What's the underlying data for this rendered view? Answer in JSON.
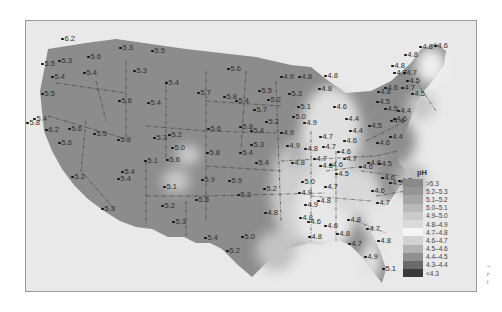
{
  "map": {
    "title": "pH of precipitation, contiguous United States",
    "legend": {
      "title": "pH",
      "items": [
        {
          "label": ">5.3",
          "color": "#8a8a8a"
        },
        {
          "label": "5.2–5.3",
          "color": "#959595"
        },
        {
          "label": "5.1–5.2",
          "color": "#a6a6a6"
        },
        {
          "label": "5.0–5.1",
          "color": "#b9b9b9"
        },
        {
          "label": "4.9–5.0",
          "color": "#cbcbcb"
        },
        {
          "label": "4.8–4.9",
          "color": "#dadada"
        },
        {
          "label": "4.7–4.8",
          "color": "#f4f4f4"
        },
        {
          "label": "4.6–4.7",
          "color": "#d2d2d2"
        },
        {
          "label": "4.5–4.6",
          "color": "#b2b2b2"
        },
        {
          "label": "4.4–4.5",
          "color": "#909090"
        },
        {
          "label": "4.3–4.4",
          "color": "#6a6a6a"
        },
        {
          "label": "<4.3",
          "color": "#3a3a3a"
        }
      ]
    },
    "stations": [
      {
        "v": "6.2",
        "x": 60,
        "y": 38
      },
      {
        "v": "5.3",
        "x": 118,
        "y": 47
      },
      {
        "v": "5.5",
        "x": 150,
        "y": 50
      },
      {
        "v": "5.5",
        "x": 40,
        "y": 63
      },
      {
        "v": "5.3",
        "x": 57,
        "y": 60
      },
      {
        "v": "5.6",
        "x": 86,
        "y": 56
      },
      {
        "v": "5.4",
        "x": 50,
        "y": 76
      },
      {
        "v": "5.4",
        "x": 82,
        "y": 72
      },
      {
        "v": "5.3",
        "x": 132,
        "y": 70
      },
      {
        "v": "5.4",
        "x": 164,
        "y": 82
      },
      {
        "v": "5.5",
        "x": 40,
        "y": 93
      },
      {
        "v": "5.6",
        "x": 117,
        "y": 100
      },
      {
        "v": "5.4",
        "x": 146,
        "y": 102
      },
      {
        "v": "5.4",
        "x": 32,
        "y": 118
      },
      {
        "v": "6.2",
        "x": 44,
        "y": 129
      },
      {
        "v": "5.6",
        "x": 67,
        "y": 128
      },
      {
        "v": "5.6",
        "x": 57,
        "y": 142
      },
      {
        "v": "5.5",
        "x": 92,
        "y": 133
      },
      {
        "v": "5.8",
        "x": 116,
        "y": 139
      },
      {
        "v": "5.8",
        "x": 25,
        "y": 122
      },
      {
        "v": "5.3",
        "x": 152,
        "y": 137
      },
      {
        "v": "5.2",
        "x": 167,
        "y": 134
      },
      {
        "v": "5.0",
        "x": 170,
        "y": 147
      },
      {
        "v": "5.1",
        "x": 143,
        "y": 160
      },
      {
        "v": "5.6",
        "x": 165,
        "y": 159
      },
      {
        "v": "5.4",
        "x": 120,
        "y": 171
      },
      {
        "v": "5.2",
        "x": 70,
        "y": 176
      },
      {
        "v": "5.4",
        "x": 116,
        "y": 178
      },
      {
        "v": "5.3",
        "x": 100,
        "y": 208
      },
      {
        "v": "5.1",
        "x": 162,
        "y": 186
      },
      {
        "v": "5.6",
        "x": 206,
        "y": 128
      },
      {
        "v": "5.8",
        "x": 205,
        "y": 152
      },
      {
        "v": "5.4",
        "x": 238,
        "y": 152
      },
      {
        "v": "5.8",
        "x": 238,
        "y": 126
      },
      {
        "v": "5.4",
        "x": 234,
        "y": 100
      },
      {
        "v": "5.7",
        "x": 196,
        "y": 92
      },
      {
        "v": "5.8",
        "x": 222,
        "y": 96
      },
      {
        "v": "5.6",
        "x": 226,
        "y": 68
      },
      {
        "v": "5.2",
        "x": 266,
        "y": 99
      },
      {
        "v": "5.5",
        "x": 257,
        "y": 90
      },
      {
        "v": "5.7",
        "x": 252,
        "y": 109
      },
      {
        "v": "5.2",
        "x": 264,
        "y": 121
      },
      {
        "v": "5.4",
        "x": 249,
        "y": 130
      },
      {
        "v": "5.3",
        "x": 249,
        "y": 144
      },
      {
        "v": "4.9",
        "x": 285,
        "y": 145
      },
      {
        "v": "5.4",
        "x": 254,
        "y": 162
      },
      {
        "v": "5.9",
        "x": 200,
        "y": 179
      },
      {
        "v": "5.9",
        "x": 227,
        "y": 180
      },
      {
        "v": "5.3",
        "x": 236,
        "y": 194
      },
      {
        "v": "5.2",
        "x": 262,
        "y": 188
      },
      {
        "v": "4.8",
        "x": 263,
        "y": 212
      },
      {
        "v": "5.5",
        "x": 194,
        "y": 199
      },
      {
        "v": "5.2",
        "x": 160,
        "y": 205
      },
      {
        "v": "5.3",
        "x": 171,
        "y": 221
      },
      {
        "v": "5.4",
        "x": 203,
        "y": 237
      },
      {
        "v": "5.0",
        "x": 240,
        "y": 236
      },
      {
        "v": "5.2",
        "x": 225,
        "y": 250
      },
      {
        "v": "4.9",
        "x": 279,
        "y": 76
      },
      {
        "v": "4.8",
        "x": 297,
        "y": 76
      },
      {
        "v": "5.3",
        "x": 287,
        "y": 93
      },
      {
        "v": "5.1",
        "x": 296,
        "y": 106
      },
      {
        "v": "5.0",
        "x": 291,
        "y": 116
      },
      {
        "v": "4.9",
        "x": 302,
        "y": 122
      },
      {
        "v": "4.9",
        "x": 279,
        "y": 132
      },
      {
        "v": "4.8",
        "x": 303,
        "y": 148
      },
      {
        "v": "4.8",
        "x": 323,
        "y": 75
      },
      {
        "v": "4.8",
        "x": 317,
        "y": 88
      },
      {
        "v": "4.6",
        "x": 332,
        "y": 106
      },
      {
        "v": "4.7",
        "x": 318,
        "y": 136
      },
      {
        "v": "4.7",
        "x": 321,
        "y": 146
      },
      {
        "v": "4.6",
        "x": 336,
        "y": 151
      },
      {
        "v": "4.8",
        "x": 290,
        "y": 162
      },
      {
        "v": "4.7",
        "x": 312,
        "y": 158
      },
      {
        "v": "4.7",
        "x": 342,
        "y": 158
      },
      {
        "v": "4.6",
        "x": 318,
        "y": 165
      },
      {
        "v": "4.6",
        "x": 328,
        "y": 164
      },
      {
        "v": "4.5",
        "x": 334,
        "y": 173
      },
      {
        "v": "4.7",
        "x": 323,
        "y": 186
      },
      {
        "v": "4.8",
        "x": 316,
        "y": 200
      },
      {
        "v": "4.6",
        "x": 323,
        "y": 225
      },
      {
        "v": "4.8",
        "x": 335,
        "y": 233
      },
      {
        "v": "4.9",
        "x": 297,
        "y": 192
      },
      {
        "v": "5.0",
        "x": 300,
        "y": 181
      },
      {
        "v": "4.9",
        "x": 303,
        "y": 204
      },
      {
        "v": "4.8",
        "x": 298,
        "y": 217
      },
      {
        "v": "4.6",
        "x": 306,
        "y": 221
      },
      {
        "v": "4.8",
        "x": 307,
        "y": 236
      },
      {
        "v": "4.8",
        "x": 346,
        "y": 219
      },
      {
        "v": "4.7",
        "x": 365,
        "y": 228
      },
      {
        "v": "4.7",
        "x": 347,
        "y": 243
      },
      {
        "v": "4.8",
        "x": 376,
        "y": 240
      },
      {
        "v": "4.9",
        "x": 363,
        "y": 256
      },
      {
        "v": "5.1",
        "x": 381,
        "y": 268
      },
      {
        "v": "4.4",
        "x": 344,
        "y": 118
      },
      {
        "v": "4.4",
        "x": 348,
        "y": 130
      },
      {
        "v": "4.6",
        "x": 342,
        "y": 140
      },
      {
        "v": "4.5",
        "x": 367,
        "y": 125
      },
      {
        "v": "4.5",
        "x": 375,
        "y": 101
      },
      {
        "v": "4.8",
        "x": 376,
        "y": 91
      },
      {
        "v": "4.4",
        "x": 389,
        "y": 120
      },
      {
        "v": "4.4",
        "x": 388,
        "y": 136
      },
      {
        "v": "4.6",
        "x": 375,
        "y": 142
      },
      {
        "v": "4.6",
        "x": 366,
        "y": 162
      },
      {
        "v": "4.5",
        "x": 377,
        "y": 163
      },
      {
        "v": "4.6",
        "x": 380,
        "y": 177
      },
      {
        "v": "4.6",
        "x": 358,
        "y": 166
      },
      {
        "v": "4.9",
        "x": 388,
        "y": 182
      },
      {
        "v": "4.7",
        "x": 397,
        "y": 180
      },
      {
        "v": "4.6",
        "x": 370,
        "y": 190
      },
      {
        "v": "4.7",
        "x": 375,
        "y": 202
      },
      {
        "v": "4.8",
        "x": 390,
        "y": 65
      },
      {
        "v": "4.7",
        "x": 392,
        "y": 72
      },
      {
        "v": "4.7",
        "x": 402,
        "y": 72
      },
      {
        "v": "4.5",
        "x": 405,
        "y": 80
      },
      {
        "v": "4.7",
        "x": 400,
        "y": 87
      },
      {
        "v": "4.6",
        "x": 383,
        "y": 87
      },
      {
        "v": "4.5",
        "x": 383,
        "y": 108
      },
      {
        "v": "4.4",
        "x": 396,
        "y": 110
      },
      {
        "v": "4.6",
        "x": 392,
        "y": 118
      },
      {
        "v": "4.8",
        "x": 418,
        "y": 46
      },
      {
        "v": "4.6",
        "x": 433,
        "y": 45
      },
      {
        "v": "4.8",
        "x": 403,
        "y": 54
      },
      {
        "v": "4.5",
        "x": 410,
        "y": 93
      }
    ]
  },
  "side_note": [
    "–",
    "r",
    "i"
  ]
}
